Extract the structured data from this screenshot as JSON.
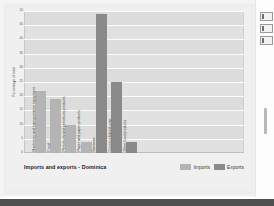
{
  "chart_data": {
    "type": "bar",
    "title": "Imports and exports - Dominica",
    "xlabel": "",
    "ylabel": "Percentage of total",
    "ylim": [
      0,
      50
    ],
    "ytick_step": 5,
    "yticks": [
      "0",
      "5",
      "10",
      "15",
      "20",
      "25",
      "30",
      "35",
      "40",
      "45",
      "50"
    ],
    "grid": true,
    "legend_position": "bottom-right",
    "categories": [
      "Machinery and transportation equipment",
      "Food",
      "Petroleum and petroleum products",
      "Paper and paper products",
      "Bananas",
      "Coconut-based soap",
      "Other food products"
    ],
    "series": [
      {
        "name": "Imports",
        "color": "#b4b4b4",
        "values": [
          22,
          19,
          10,
          4,
          null,
          null,
          null
        ]
      },
      {
        "name": "Exports",
        "color": "#8a8a8a",
        "values": [
          null,
          null,
          null,
          null,
          49,
          25,
          4
        ]
      }
    ],
    "bars": [
      {
        "category": "Machinery and transportation equipment",
        "series": "Imports",
        "value": 22
      },
      {
        "category": "Food",
        "series": "Imports",
        "value": 19
      },
      {
        "category": "Petroleum and petroleum products",
        "series": "Imports",
        "value": 10
      },
      {
        "category": "Paper and paper products",
        "series": "Imports",
        "value": 4
      },
      {
        "category": "Bananas",
        "series": "Exports",
        "value": 49
      },
      {
        "category": "Coconut-based soap",
        "series": "Exports",
        "value": 25
      },
      {
        "category": "Other food products",
        "series": "Exports",
        "value": 4
      }
    ]
  },
  "legend": {
    "items": [
      {
        "label": "Imports",
        "color": "#b4b4b4"
      },
      {
        "label": "Exports",
        "color": "#8a8a8a"
      }
    ]
  },
  "colors": {
    "imports": "#b4b4b4",
    "exports": "#8a8a8a",
    "plot_background": "#dcdcdc",
    "gridline": "#fbfbfb",
    "card_background": "#f0f0f0",
    "page_background": "#f4f4f4",
    "bottom_bar": "#4e4e4e"
  },
  "edge_toolbar": {
    "buttons": [
      {
        "icon": "panel-icon"
      },
      {
        "icon": "panel-icon"
      },
      {
        "icon": "panel-icon"
      }
    ],
    "scrollbar_thumb": ""
  }
}
